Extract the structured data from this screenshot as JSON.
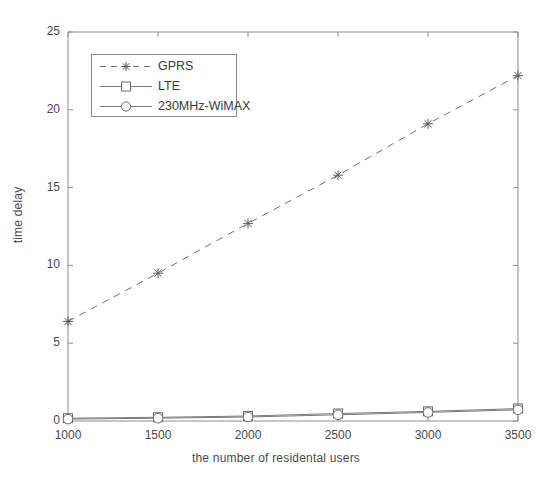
{
  "figure": {
    "background": "#ffffff",
    "frame_color": "#8d8d8d"
  },
  "axis": {
    "xlabel": "the number of  residental users",
    "ylabel": "time delay",
    "xticks": [
      "1000",
      "1500",
      "2000",
      "2500",
      "3000",
      "3500"
    ],
    "yticks": [
      "0",
      "5",
      "10",
      "15",
      "20",
      "25"
    ]
  },
  "legend": {
    "entries": [
      {
        "label": "GPRS",
        "marker": "star-marker",
        "linestyle": "dashed",
        "color": "#6f6f6f"
      },
      {
        "label": "LTE",
        "marker": "square-marker",
        "linestyle": "solid",
        "color": "#7a7a7a"
      },
      {
        "label": "230MHz-WiMAX",
        "marker": "circle-marker",
        "linestyle": "solid",
        "color": "#7a7a7a"
      }
    ]
  },
  "chart_data": {
    "type": "line",
    "title": "",
    "xlabel": "the number of  residental users",
    "ylabel": "time delay",
    "x": [
      1000,
      1500,
      2000,
      2500,
      3000,
      3500
    ],
    "xlim": [
      1000,
      3500
    ],
    "ylim": [
      0,
      25
    ],
    "grid": false,
    "legend_position": "upper-left",
    "series": [
      {
        "name": "GPRS",
        "marker": "star",
        "linestyle": "dashed",
        "color": "#6f6f6f",
        "values": [
          6.4,
          9.5,
          12.7,
          15.8,
          19.1,
          22.2
        ]
      },
      {
        "name": "LTE",
        "marker": "square",
        "linestyle": "solid",
        "color": "#7a7a7a",
        "values": [
          0.18,
          0.24,
          0.32,
          0.48,
          0.62,
          0.8
        ]
      },
      {
        "name": "230MHz-WiMAX",
        "marker": "circle",
        "linestyle": "solid",
        "color": "#7a7a7a",
        "values": [
          0.12,
          0.18,
          0.26,
          0.4,
          0.55,
          0.72
        ]
      }
    ]
  }
}
